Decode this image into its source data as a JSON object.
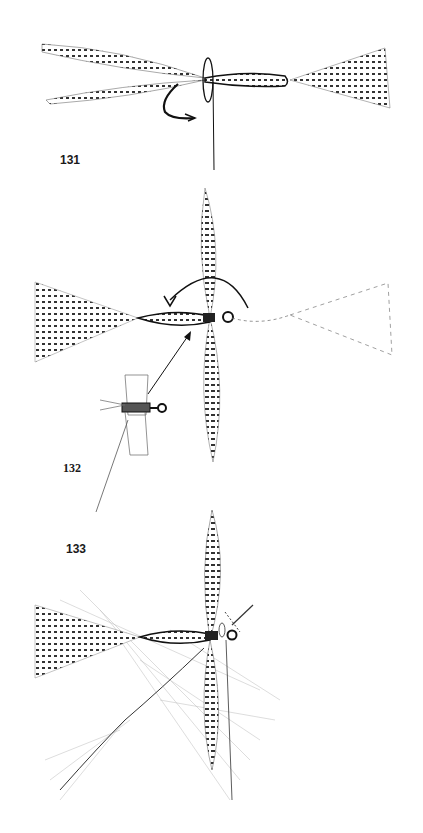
{
  "figures": [
    {
      "number": "131",
      "description": "Hackle feathers tied on hook shank with thread loop; tail fan at right"
    },
    {
      "number": "132",
      "description": "Extended body fly with wing, arrow showing rotation of tail fan; small inset fly with arrow"
    },
    {
      "number": "133",
      "description": "Completed extended body fly with upright wing and hackle feather being wound"
    }
  ],
  "colors": {
    "ink": "#1a1a1a",
    "background": "#ffffff",
    "light_ink": "#8a8a8a"
  }
}
